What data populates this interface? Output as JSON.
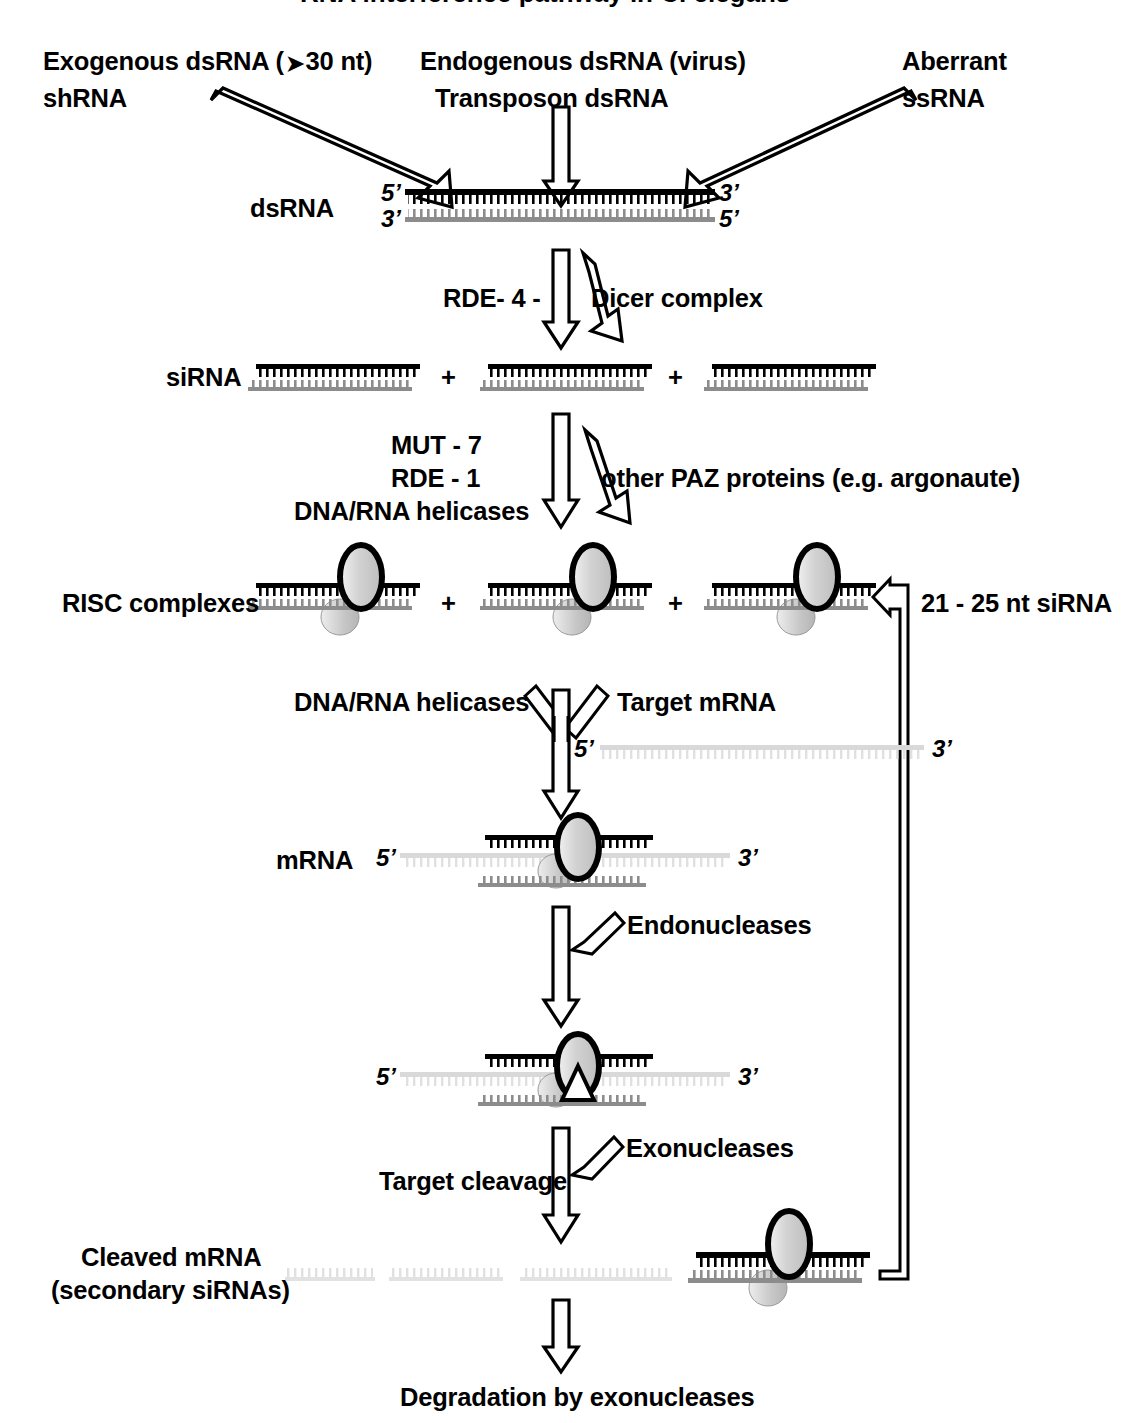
{
  "figure": {
    "title_clipped": "RNA interference pathway in C. elegans",
    "domain": "biology-pathway-diagram"
  },
  "inputs": {
    "left": {
      "line1": "Exogenous dsRNA ( ❱ 30 nt)",
      "line1_pre": "Exogenous dsRNA (",
      "line1_sym": "➤",
      "line1_post": "30 nt)",
      "line2": "shRNA"
    },
    "center": {
      "line1": "Endogenous dsRNA (virus)",
      "line2": "Transposon dsRNA"
    },
    "right": {
      "line1": "Aberrant",
      "line2": "ssRNA"
    }
  },
  "rows": {
    "dsrna": {
      "label": "dsRNA",
      "top_left_prime": "5’",
      "top_right_prime": "3’",
      "bottom_left_prime": "3’",
      "bottom_right_prime": "5’"
    },
    "sirna": {
      "label": "siRNA",
      "plus": "+"
    },
    "risc": {
      "label": "RISC complexes",
      "plus": "+",
      "feedback_label": "21 - 25 nt siRNA"
    },
    "mrna": {
      "label": "mRNA",
      "left_prime": "5’",
      "right_prime": "3’"
    },
    "target_mrna": {
      "label": "Target mRNA",
      "left_prime": "5’",
      "right_prime": "3’"
    },
    "cleaved": {
      "line1": "Cleaved mRNA",
      "line2": "(secondary siRNAs)",
      "left_prime": "5’",
      "right_prime": "3’"
    },
    "final": {
      "label": "Degradation by exonucleases"
    }
  },
  "enzymes": {
    "dicer_left": "RDE- 4 -",
    "dicer_right": "Dicer complex",
    "risc_left_1": "MUT - 7",
    "risc_left_2": "RDE - 1",
    "risc_left_3": "DNA/RNA helicases",
    "risc_right": "other PAZ proteins (e.g. argonaute)",
    "helicases": "DNA/RNA helicases",
    "endonucleases": "Endonucleases",
    "exonucleases": "Exonucleases",
    "target_cleavage": "Target cleavage"
  },
  "colors": {
    "ink": "#000000",
    "strand_gray": "#8c8c8c",
    "strand_light": "#d9d9d9",
    "complex_fill": "#cccccc",
    "background": "#ffffff"
  }
}
